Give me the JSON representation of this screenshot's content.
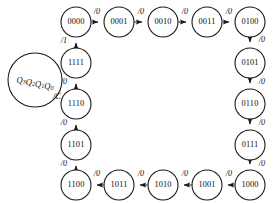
{
  "diagram": {
    "type": "finite-state-machine",
    "background_color": "#ffffff",
    "stroke_color": "#1a1a1a",
    "legend": {
      "state_encoding": "Q3Q2Q1Q0",
      "encoding_parts": [
        {
          "base": "Q",
          "sub": "3"
        },
        {
          "base": "Q",
          "sub": "2"
        },
        {
          "base": "Q",
          "sub": "1"
        },
        {
          "base": "Q",
          "sub": "0"
        }
      ],
      "output_label": "/C",
      "center": {
        "x": 35,
        "y": 80
      },
      "radius": 27
    },
    "state_radius": 15,
    "states": [
      {
        "id": "s0",
        "label": "0000",
        "cx": 76,
        "cy": 22
      },
      {
        "id": "s1",
        "label": "0001",
        "cx": 119,
        "cy": 22
      },
      {
        "id": "s2",
        "label": "0010",
        "cx": 163,
        "cy": 22
      },
      {
        "id": "s3",
        "label": "0011",
        "cx": 207,
        "cy": 22
      },
      {
        "id": "s4",
        "label": "0100",
        "cx": 250,
        "cy": 22
      },
      {
        "id": "s5",
        "label": "0101",
        "cx": 250,
        "cy": 63
      },
      {
        "id": "s6",
        "label": "0110",
        "cx": 250,
        "cy": 104
      },
      {
        "id": "s7",
        "label": "0111",
        "cx": 250,
        "cy": 145
      },
      {
        "id": "s8",
        "label": "1000",
        "cx": 250,
        "cy": 185
      },
      {
        "id": "s9",
        "label": "1001",
        "cx": 207,
        "cy": 185
      },
      {
        "id": "s10",
        "label": "1010",
        "cx": 163,
        "cy": 185
      },
      {
        "id": "s11",
        "label": "1011",
        "cx": 119,
        "cy": 185
      },
      {
        "id": "s12",
        "label": "1100",
        "cx": 76,
        "cy": 185
      },
      {
        "id": "s13",
        "label": "1101",
        "cx": 76,
        "cy": 145
      },
      {
        "id": "s14",
        "label": "1110",
        "cx": 76,
        "cy": 104
      },
      {
        "id": "s15",
        "label": "1111",
        "cx": 76,
        "cy": 63
      }
    ],
    "transitions": [
      {
        "from": "s0",
        "to": "s1",
        "label": "/0",
        "label_x": 97,
        "label_y": 12
      },
      {
        "from": "s1",
        "to": "s2",
        "label": "/0",
        "label_x": 141,
        "label_y": 12
      },
      {
        "from": "s2",
        "to": "s3",
        "label": "/0",
        "label_x": 185,
        "label_y": 12
      },
      {
        "from": "s3",
        "to": "s4",
        "label": "/0",
        "label_x": 229,
        "label_y": 12
      },
      {
        "from": "s4",
        "to": "s5",
        "label": "/0",
        "label_x": 262,
        "label_y": 40
      },
      {
        "from": "s5",
        "to": "s6",
        "label": "/0",
        "label_x": 262,
        "label_y": 82
      },
      {
        "from": "s6",
        "to": "s7",
        "label": "/0",
        "label_x": 262,
        "label_y": 123
      },
      {
        "from": "s7",
        "to": "s8",
        "label": "/0",
        "label_x": 262,
        "label_y": 164
      },
      {
        "from": "s8",
        "to": "s9",
        "label": "/0",
        "label_x": 229,
        "label_y": 174
      },
      {
        "from": "s9",
        "to": "s10",
        "label": "/0",
        "label_x": 185,
        "label_y": 174
      },
      {
        "from": "s10",
        "to": "s11",
        "label": "/0",
        "label_x": 141,
        "label_y": 174
      },
      {
        "from": "s11",
        "to": "s12",
        "label": "/0",
        "label_x": 97,
        "label_y": 174
      },
      {
        "from": "s12",
        "to": "s13",
        "label": "/0",
        "label_x": 64,
        "label_y": 164
      },
      {
        "from": "s13",
        "to": "s14",
        "label": "/0",
        "label_x": 64,
        "label_y": 123
      },
      {
        "from": "s14",
        "to": "s15",
        "label": "/0",
        "label_x": 64,
        "label_y": 82
      },
      {
        "from": "s15",
        "to": "s0",
        "label": "/1",
        "label_x": 64,
        "label_y": 41
      }
    ]
  }
}
